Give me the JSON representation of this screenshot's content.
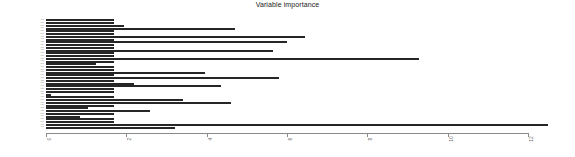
{
  "chart_data": {
    "type": "bar",
    "orientation": "horizontal",
    "title": "Variable importance",
    "xlabel": "",
    "ylabel": "",
    "xlim": [
      0,
      12.5
    ],
    "grid": false,
    "legend": null,
    "bar_color": "#262626",
    "axis_color": "#8a8a8a",
    "xticks": [
      0,
      2,
      4,
      6,
      8,
      10,
      12
    ],
    "xtick_labels": [
      "0",
      "2",
      "4",
      "6",
      "8",
      "10",
      "12"
    ],
    "categories": [
      "V01",
      "V02",
      "V03",
      "V04",
      "V05",
      "V06",
      "V07",
      "V08",
      "V09",
      "V10",
      "V11",
      "V12",
      "V13",
      "V14",
      "V15",
      "V16",
      "V17",
      "V18",
      "V19",
      "V20",
      "V21",
      "V22",
      "V23",
      "V24",
      "V25",
      "V26",
      "V27",
      "V28",
      "V29",
      "V30",
      "V31",
      "V32",
      "V33",
      "V34",
      "V35",
      "V36",
      "V37",
      "V38",
      "V39",
      "V40"
    ],
    "values": [
      1.7,
      1.7,
      1.95,
      4.7,
      1.7,
      1.7,
      6.45,
      1.7,
      6.0,
      1.7,
      1.7,
      5.65,
      1.7,
      1.7,
      9.3,
      1.7,
      1.25,
      1.7,
      1.7,
      3.95,
      1.7,
      5.8,
      1.7,
      2.2,
      4.35,
      1.7,
      1.7,
      0.13,
      1.7,
      3.4,
      4.6,
      1.7,
      1.05,
      2.6,
      1.7,
      0.85,
      1.7,
      1.7,
      12.5,
      3.2
    ]
  },
  "ylabels": [
    "var",
    "var",
    "var",
    "var",
    "var",
    "var",
    "var",
    "var",
    "var",
    "var",
    "var",
    "var",
    "var",
    "var",
    "var",
    "var",
    "var",
    "var",
    "var",
    "var",
    "var",
    "var",
    "var",
    "var",
    "var",
    "var",
    "var",
    "var",
    "var",
    "var",
    "var",
    "var",
    "var",
    "var",
    "var",
    "var",
    "var",
    "var",
    "var",
    "var"
  ]
}
